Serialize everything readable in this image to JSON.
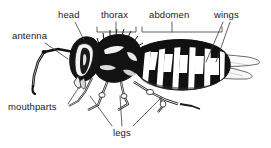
{
  "figure": {
    "background_color": "#ffffff",
    "ink_color": "#111111",
    "leader_color": "#3a3a3a",
    "width": 271,
    "height": 148
  },
  "labels": {
    "antenna": "antenna",
    "head": "head",
    "thorax": "thorax",
    "abdomen": "abdomen",
    "wings": "wings",
    "mouthparts": "mouthparts",
    "legs": "legs"
  },
  "annotations": [
    {
      "id": "antenna",
      "label": "antenna",
      "label_x": 12,
      "label_y": 30,
      "connector": "line",
      "line": [
        [
          45,
          43
        ],
        [
          68,
          59
        ]
      ]
    },
    {
      "id": "head",
      "label": "head",
      "label_x": 58,
      "label_y": 9,
      "connector": "line",
      "line": [
        [
          75,
          22
        ],
        [
          84,
          40
        ]
      ]
    },
    {
      "id": "thorax",
      "label": "thorax",
      "label_x": 101,
      "label_y": 9,
      "connector": "bracket",
      "bracket": {
        "x1": 97,
        "x2": 136,
        "y": 32,
        "tick": 5
      },
      "stem": [
        [
          116,
          22
        ],
        [
          116,
          32
        ]
      ]
    },
    {
      "id": "abdomen",
      "label": "abdomen",
      "label_x": 149,
      "label_y": 9,
      "connector": "bracket",
      "bracket": {
        "x1": 142,
        "x2": 222,
        "y": 32,
        "tick": 5
      },
      "stem": [
        [
          172,
          22
        ],
        [
          172,
          32
        ]
      ]
    },
    {
      "id": "wings",
      "label": "wings",
      "label_x": 216,
      "label_y": 9,
      "connector": "lines",
      "lines": [
        [
          [
            223,
            22
          ],
          [
            206,
            62
          ]
        ],
        [
          [
            229,
            22
          ],
          [
            215,
            62
          ]
        ]
      ]
    },
    {
      "id": "mouthparts",
      "label": "mouthparts",
      "label_x": 8,
      "label_y": 101,
      "connector": "line",
      "line": [
        [
          66,
          104
        ],
        [
          78,
          86
        ]
      ]
    },
    {
      "id": "legs",
      "label": "legs",
      "label_x": 114,
      "label_y": 128,
      "connector": "lines",
      "lines": [
        [
          [
            112,
            126
          ],
          [
            90,
            95
          ]
        ],
        [
          [
            122,
            126
          ],
          [
            120,
            95
          ]
        ],
        [
          [
            133,
            126
          ],
          [
            160,
            97
          ]
        ]
      ]
    }
  ]
}
